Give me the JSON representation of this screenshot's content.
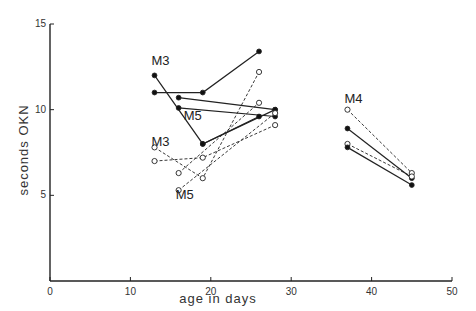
{
  "chart_data": {
    "type": "line",
    "title": "",
    "xlabel": "age in days",
    "ylabel": "seconds OKN",
    "xlim": [
      0,
      50
    ],
    "ylim": [
      0,
      15
    ],
    "xticks": [
      0,
      10,
      20,
      30,
      40,
      50
    ],
    "yticks": [
      5,
      10,
      15
    ],
    "grid": false,
    "legend": "none",
    "annotations": [
      {
        "text": "M3",
        "x": 13,
        "y": 12.6
      },
      {
        "text": "M5",
        "x": 17,
        "y": 9.4
      },
      {
        "text": "M3",
        "x": 13,
        "y": 7.9
      },
      {
        "text": "M5",
        "x": 16,
        "y": 4.8
      },
      {
        "text": "M4",
        "x": 37,
        "y": 10.4
      }
    ],
    "series": [
      {
        "name": "M3 solid 1",
        "style": "solid-filled",
        "points": [
          [
            13,
            12.0
          ],
          [
            19,
            8.0
          ],
          [
            28,
            10.0
          ]
        ]
      },
      {
        "name": "M3 solid 2",
        "style": "solid-filled",
        "points": [
          [
            13,
            11.0
          ],
          [
            19,
            11.0
          ],
          [
            26,
            13.4
          ]
        ]
      },
      {
        "name": "M5 solid 1",
        "style": "solid-filled",
        "points": [
          [
            16,
            10.7
          ],
          [
            28,
            10.0
          ]
        ]
      },
      {
        "name": "M5 solid 2",
        "style": "solid-filled",
        "points": [
          [
            16,
            10.1
          ],
          [
            28,
            9.6
          ]
        ]
      },
      {
        "name": "M5 solid 3",
        "style": "solid-filled",
        "points": [
          [
            19,
            8.0
          ],
          [
            26,
            9.6
          ]
        ]
      },
      {
        "name": "M3 dashed 1",
        "style": "dashed-open",
        "points": [
          [
            13,
            7.8
          ],
          [
            19,
            6.0
          ],
          [
            26,
            12.2
          ]
        ]
      },
      {
        "name": "M3 dashed 2",
        "style": "dashed-open",
        "points": [
          [
            13,
            7.0
          ],
          [
            19,
            7.2
          ],
          [
            28,
            9.1
          ]
        ]
      },
      {
        "name": "M5 dashed 1",
        "style": "dashed-open",
        "points": [
          [
            16,
            6.3
          ],
          [
            26,
            10.4
          ]
        ]
      },
      {
        "name": "M5 dashed 2",
        "style": "dashed-open",
        "points": [
          [
            16,
            5.3
          ],
          [
            28,
            9.8
          ]
        ]
      },
      {
        "name": "M4 dashed 1",
        "style": "dashed-open",
        "points": [
          [
            37,
            10.0
          ],
          [
            45,
            6.3
          ]
        ]
      },
      {
        "name": "M4 solid 1",
        "style": "solid-filled",
        "points": [
          [
            37,
            8.9
          ],
          [
            45,
            6.0
          ]
        ]
      },
      {
        "name": "M4 dashed 2",
        "style": "dashed-open",
        "points": [
          [
            37,
            8.0
          ],
          [
            45,
            6.1
          ]
        ]
      },
      {
        "name": "M4 solid 2",
        "style": "solid-filled",
        "points": [
          [
            37,
            7.8
          ],
          [
            45,
            5.6
          ]
        ]
      }
    ]
  }
}
